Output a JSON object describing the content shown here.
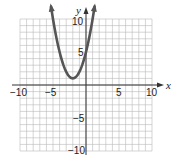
{
  "chart_data": {
    "type": "line",
    "title": "",
    "xlabel": "x",
    "ylabel": "y",
    "xlim": [
      -10,
      10
    ],
    "ylim": [
      -10,
      10
    ],
    "grid": true,
    "grid_step": 1,
    "x_tick_labels": [
      "-10",
      "-5",
      "5",
      "10"
    ],
    "y_tick_labels": [
      "10",
      "5",
      "-5",
      "-10"
    ],
    "series": [
      {
        "name": "parabola",
        "equation": "y = (x + 2)^2 + 1",
        "vertex": [
          -2,
          1
        ],
        "color": "#555555",
        "arrows": "both ends",
        "x": [
          -5.3,
          -5,
          -4,
          -3,
          -2,
          -1,
          0,
          1,
          1.3
        ],
        "values": [
          11.9,
          10,
          5,
          2,
          1,
          2,
          5,
          10,
          11.9
        ]
      }
    ]
  },
  "labels": {
    "x_axis": "x",
    "y_axis": "y",
    "x_neg10": "−10",
    "x_neg5": "−5",
    "x_5": "5",
    "x_10": "10",
    "y_10": "10",
    "y_5": "5",
    "y_neg5": "−5",
    "y_neg10": "−10"
  },
  "colors": {
    "grid": "#b8b8b8",
    "axis": "#333333",
    "curve": "#555555"
  }
}
